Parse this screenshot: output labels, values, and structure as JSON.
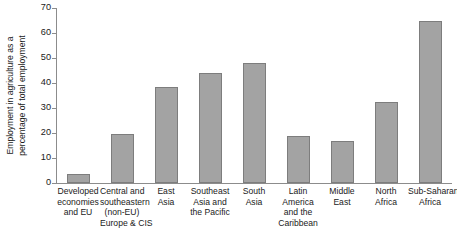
{
  "chart_data": {
    "type": "bar",
    "title": "",
    "subtitle": "",
    "xlabel": "",
    "ylabel": "Employment in agriculture as a percentage of total employment",
    "ylabel_lines": [
      "Employment in agriculture as a",
      "percentage of total employment"
    ],
    "ylim": [
      0,
      70
    ],
    "ytick_values": [
      0,
      10,
      20,
      30,
      40,
      50,
      60,
      70
    ],
    "ytick_labels": [
      "0",
      "10",
      "20",
      "30",
      "40",
      "50",
      "60",
      "70"
    ],
    "grid": false,
    "legend": false,
    "legend_position": "none",
    "bar_color": "#a3a3a3",
    "bar_border_color": "#7d7d7d",
    "axis_color": "#8c8c8c",
    "background_color": "#ffffff",
    "categories": [
      "Developed economies and EU",
      "Central and southeastern (non-EU) Europe & CIS",
      "East Asia",
      "Southeast Asia and the Pacific",
      "South Asia",
      "Latin America and the Caribbean",
      "Middle East",
      "North Africa",
      "Sub-Saharan Africa"
    ],
    "category_label_lines": [
      [
        "Developed",
        "economies",
        "and EU"
      ],
      [
        "Central and",
        "southeastern",
        "(non-EU)",
        "Europe & CIS"
      ],
      [
        "East",
        "Asia"
      ],
      [
        "Southeast",
        "Asia and",
        "the Pacific"
      ],
      [
        "South",
        "Asia"
      ],
      [
        "Latin",
        "America",
        "and the",
        "Caribbean"
      ],
      [
        "Middle",
        "East"
      ],
      [
        "North",
        "Africa"
      ],
      [
        "Sub-Saharan",
        "Africa"
      ]
    ],
    "values": [
      3.5,
      19.5,
      38.5,
      44,
      48,
      19,
      17,
      32.5,
      65
    ]
  }
}
